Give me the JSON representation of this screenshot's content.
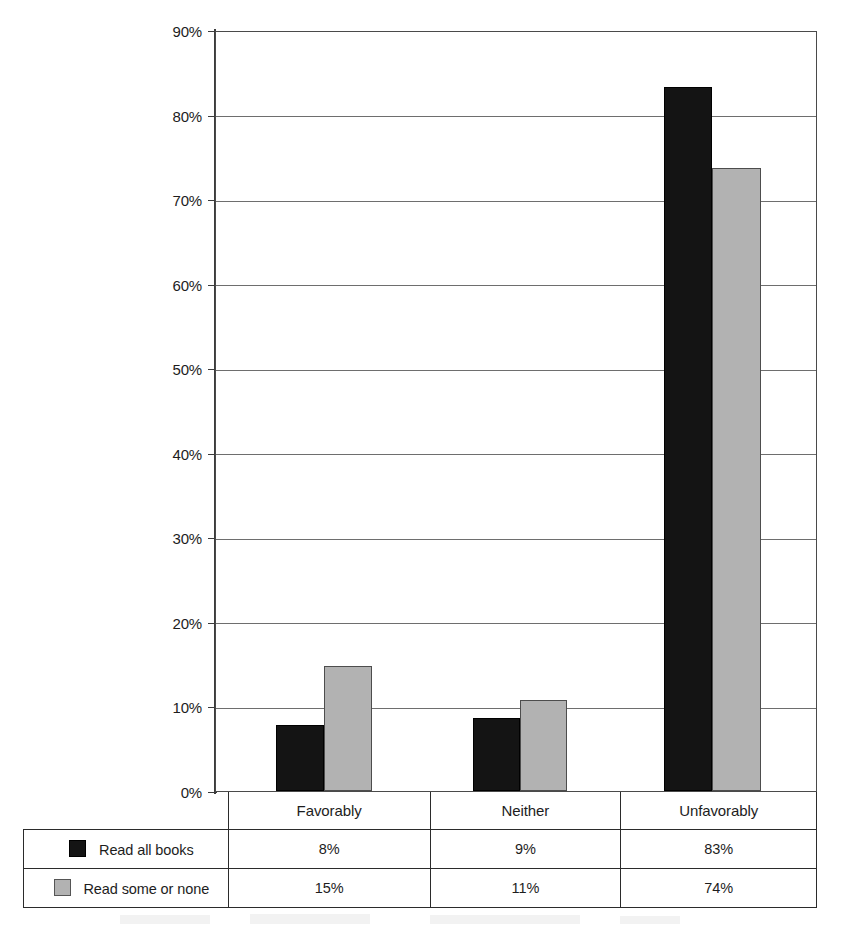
{
  "chart_data": {
    "type": "bar",
    "title": "",
    "subtitle": "",
    "xlabel": "",
    "ylabel": "",
    "categories": [
      "Favorably",
      "Neither",
      "Unfavorably"
    ],
    "series": [
      {
        "name": "Read all books",
        "color": "#141414",
        "values": [
          8,
          9,
          83
        ],
        "plotted_values": [
          7.8,
          8.6,
          83.5
        ]
      },
      {
        "name": "Read some or none",
        "color": "#b2b2b2",
        "values": [
          15,
          11,
          74
        ],
        "plotted_values": [
          14.8,
          10.8,
          73.9
        ]
      }
    ],
    "ylim": [
      0,
      90
    ],
    "ytick_step": 10,
    "ytick_labels": [
      "0%",
      "10%",
      "20%",
      "30%",
      "40%",
      "50%",
      "60%",
      "70%",
      "80%",
      "90%"
    ],
    "ytick_values": [
      0,
      10,
      20,
      30,
      40,
      50,
      60,
      70,
      80,
      90
    ],
    "grid": true,
    "grid_axis": "y",
    "legend_position": "data-table-left",
    "value_suffix": "%",
    "bar_value_labels": {
      "Read all books": [
        "8%",
        "9%",
        "83%"
      ],
      "Read some or none": [
        "15%",
        "11%",
        "74%"
      ]
    }
  },
  "table": {
    "column_headers": [
      "",
      "Favorably",
      "Neither",
      "Unfavorably"
    ],
    "rows": [
      {
        "legend_label": "Read all books",
        "swatch": "black-square-icon",
        "cells": [
          "8%",
          "9%",
          "83%"
        ]
      },
      {
        "legend_label": "Read some or none",
        "swatch": "gray-square-icon",
        "cells": [
          "15%",
          "11%",
          "74%"
        ]
      }
    ]
  },
  "colors": {
    "series_1": "#141414",
    "series_2": "#b2b2b2",
    "gridline": "#6e6e6e",
    "axis": "#3c3c3c",
    "text": "#1d1d1d",
    "background": "#ffffff"
  }
}
